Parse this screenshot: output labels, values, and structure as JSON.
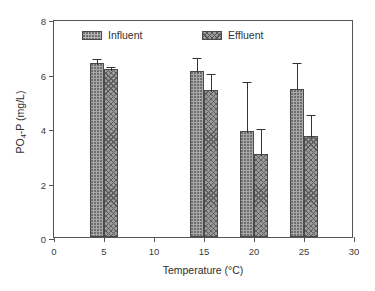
{
  "chart_data": {
    "type": "bar",
    "title": "",
    "subtitle": "",
    "xlabel": "Temperature (°C)",
    "ylabel_prefix": "PO",
    "ylabel_sub": "4",
    "ylabel_suffix": "-P (mg/L)",
    "ylabel": "PO4-P (mg/L)",
    "categories": [
      5,
      15,
      20,
      25
    ],
    "category_labels": [
      "5",
      "15",
      "20",
      "25"
    ],
    "xlim": [
      0,
      30
    ],
    "ylim": [
      0,
      8
    ],
    "xticks": [
      0,
      5,
      10,
      15,
      20,
      25,
      30
    ],
    "xtick_labels": [
      "0",
      "5",
      "10",
      "15",
      "20",
      "25",
      "30"
    ],
    "yticks": [
      0,
      2,
      4,
      6,
      8
    ],
    "ytick_labels": [
      "0",
      "2",
      "4",
      "6",
      "8"
    ],
    "grid": false,
    "legend_position": "upper-center",
    "bar_width_units": 1.4,
    "series": [
      {
        "name": "Influent",
        "pattern": "dotted",
        "color": "#a8a8a8",
        "values": [
          6.4,
          6.1,
          3.9,
          5.45
        ],
        "errors": [
          0.2,
          0.55,
          1.85,
          1.0
        ]
      },
      {
        "name": "Effluent",
        "pattern": "cross-hatch",
        "color": "#9a9a9a",
        "values": [
          6.15,
          5.4,
          3.05,
          3.7
        ],
        "errors": [
          0.15,
          0.65,
          1.0,
          0.85
        ]
      }
    ]
  },
  "legend": {
    "entries": [
      {
        "label": "Influent",
        "pattern": "influent"
      },
      {
        "label": "Effluent",
        "pattern": "effluent"
      }
    ]
  }
}
